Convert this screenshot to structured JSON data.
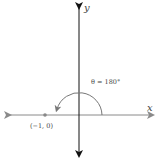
{
  "diagram": {
    "axis_labels": {
      "x": "x",
      "y": "y"
    },
    "angle_label": "θ = 180°",
    "angle_degrees": 180,
    "point": {
      "label": "(−1, 0)",
      "x": -1,
      "y": 0
    },
    "colors": {
      "y_axis": "#111111",
      "x_axis": "#8a8a8a",
      "arc": "#777777",
      "point": "#888888",
      "text": "#444444"
    }
  }
}
